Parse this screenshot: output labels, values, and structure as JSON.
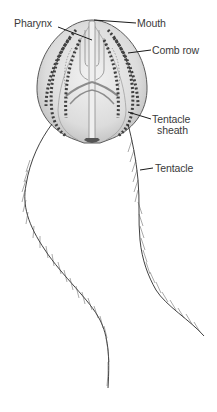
{
  "diagram": {
    "labels": {
      "pharynx": "Pharynx",
      "mouth": "Mouth",
      "comb_row": "Comb row",
      "tentacle_sheath_line1": "Tentacle",
      "tentacle_sheath_line2": "sheath",
      "tentacle": "Tentacle"
    },
    "colors": {
      "body_fill": "#e4e4e4",
      "body_stroke": "#555555",
      "comb_dots": "#4a4a4a",
      "leader_line": "#1a1a1a",
      "label_text": "#3a3a3a",
      "tentacle": "#2a2a2a"
    }
  }
}
